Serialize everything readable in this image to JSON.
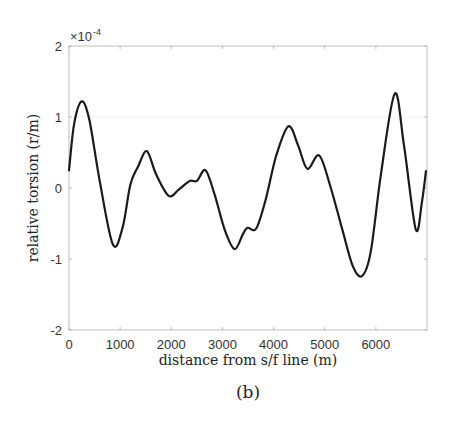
{
  "figure": {
    "caption": "(b)"
  },
  "chart_data": {
    "type": "line",
    "title": "",
    "xlabel": "distance from s/f line (m)",
    "ylabel": "relative torsion (r/m)",
    "y_exponent_label": "×10",
    "y_exponent_power": "-4",
    "xlim": [
      0,
      7000
    ],
    "ylim": [
      -2,
      2
    ],
    "y_scale_factor": 0.0001,
    "x_ticks": [
      0,
      1000,
      2000,
      3000,
      4000,
      5000,
      6000
    ],
    "x_tick_labels": [
      "0",
      "1000",
      "2000",
      "3000",
      "4000",
      "5000",
      "6000"
    ],
    "y_ticks": [
      -2,
      -1,
      0,
      1,
      2
    ],
    "y_tick_labels": [
      "-2",
      "-1",
      "0",
      "1",
      "2"
    ],
    "grid": false,
    "reference_lines": [
      {
        "y": 1,
        "style": "dotted",
        "color": "#e6e6e6"
      }
    ],
    "legend": null,
    "series": [
      {
        "name": "relative torsion",
        "color": "#1a1a1a",
        "x": [
          0,
          100,
          250,
          400,
          600,
          860,
          1050,
          1200,
          1350,
          1520,
          1700,
          1950,
          2150,
          2360,
          2500,
          2670,
          2850,
          3050,
          3240,
          3400,
          3490,
          3660,
          3850,
          4050,
          4290,
          4480,
          4660,
          4890,
          5100,
          5350,
          5550,
          5730,
          5900,
          6100,
          6370,
          6550,
          6780,
          6900,
          6980
        ],
        "values": [
          0.25,
          0.9,
          1.22,
          0.95,
          0.1,
          -0.8,
          -0.55,
          0.05,
          0.3,
          0.52,
          0.2,
          -0.11,
          -0.02,
          0.1,
          0.1,
          0.25,
          -0.1,
          -0.6,
          -0.86,
          -0.65,
          -0.56,
          -0.57,
          -0.15,
          0.45,
          0.87,
          0.6,
          0.27,
          0.46,
          0.05,
          -0.6,
          -1.1,
          -1.24,
          -0.9,
          0.2,
          1.33,
          0.6,
          -0.58,
          -0.2,
          0.24
        ]
      }
    ]
  }
}
